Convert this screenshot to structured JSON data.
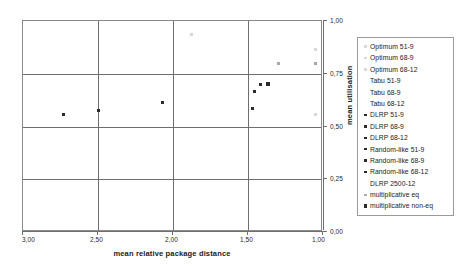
{
  "chart_data": {
    "type": "scatter",
    "title": "",
    "xlabel": "mean relative package distance",
    "ylabel": "mean utilisation",
    "xlim": [
      3.0,
      1.0
    ],
    "ylim": [
      0.0,
      1.0
    ],
    "x_axis_reversed": true,
    "y_axis_position": "right",
    "grid": true,
    "legend_position": "right-outside",
    "xticklabels": [
      "3,00",
      "2,50",
      "2,00",
      "1,50",
      "1,00"
    ],
    "xtickvalues": [
      3.0,
      2.5,
      2.0,
      1.5,
      1.0
    ],
    "yticklabels": [
      "1,00",
      "0,75",
      "0,50",
      "0,25",
      "0,00"
    ],
    "ytickvalues": [
      1.0,
      0.75,
      0.5,
      0.25,
      0.0
    ],
    "series": [
      {
        "name": "Optimum 51-9",
        "marker_style": "faint",
        "points": [
          {
            "x": 1.88,
            "y": 0.935
          }
        ]
      },
      {
        "name": "Optimum 68-9",
        "marker_style": "faint",
        "points": [
          {
            "x": 1.05,
            "y": 0.865
          }
        ]
      },
      {
        "name": "Optimum 68-12",
        "marker_style": "faint",
        "points": [
          {
            "x": 1.05,
            "y": 0.555
          }
        ]
      },
      {
        "name": "Tabu 51-9",
        "marker_style": "none",
        "points": []
      },
      {
        "name": "Tabu 68-9",
        "marker_style": "none",
        "points": []
      },
      {
        "name": "Tabu 68-12",
        "marker_style": "none",
        "points": []
      },
      {
        "name": "DLRP 51-9",
        "marker_style": "dark",
        "points": [
          {
            "x": 2.73,
            "y": 0.555
          }
        ]
      },
      {
        "name": "DLRP 68-9",
        "marker_style": "dark",
        "points": [
          {
            "x": 2.5,
            "y": 0.575
          }
        ]
      },
      {
        "name": "DLRP 68-12",
        "marker_style": "dark",
        "points": [
          {
            "x": 2.07,
            "y": 0.615
          }
        ]
      },
      {
        "name": "Random-like 51-9",
        "marker_style": "dark",
        "points": [
          {
            "x": 1.46,
            "y": 0.665
          }
        ]
      },
      {
        "name": "Random-like 68-9",
        "marker_style": "dark",
        "points": [
          {
            "x": 1.47,
            "y": 0.585
          }
        ]
      },
      {
        "name": "Random-like 68-12",
        "marker_style": "dark",
        "points": [
          {
            "x": 1.37,
            "y": 0.7
          }
        ]
      },
      {
        "name": "DLRP 2500-12",
        "marker_style": "none",
        "points": []
      },
      {
        "name": "multiplicative eq",
        "marker_style": "mid",
        "points": [
          {
            "x": 1.3,
            "y": 0.8
          },
          {
            "x": 1.05,
            "y": 0.8
          }
        ]
      },
      {
        "name": "multiplicative non-eq",
        "marker_style": "dark-big",
        "points": [
          {
            "x": 1.365,
            "y": 0.7
          }
        ]
      }
    ],
    "plotted_points": [
      {
        "x": 2.73,
        "y": 0.555,
        "style": "dark"
      },
      {
        "x": 2.5,
        "y": 0.575,
        "style": "dark"
      },
      {
        "x": 2.07,
        "y": 0.615,
        "style": "dark"
      },
      {
        "x": 1.88,
        "y": 0.935,
        "style": "faint"
      },
      {
        "x": 1.46,
        "y": 0.665,
        "style": "dark"
      },
      {
        "x": 1.47,
        "y": 0.585,
        "style": "dark"
      },
      {
        "x": 1.37,
        "y": 0.7,
        "style": "dark-big"
      },
      {
        "x": 1.3,
        "y": 0.8,
        "style": "mid"
      },
      {
        "x": 1.05,
        "y": 0.865,
        "style": "faint"
      },
      {
        "x": 1.05,
        "y": 0.8,
        "style": "mid"
      },
      {
        "x": 1.05,
        "y": 0.555,
        "style": "faint"
      },
      {
        "x": 1.42,
        "y": 0.7,
        "style": "dark"
      }
    ]
  },
  "legend": {
    "items": [
      {
        "label": "Optimum 51-9",
        "marker": "faint"
      },
      {
        "label": "Optimum 68-9",
        "marker": "faint"
      },
      {
        "label": "Optimum 68-12",
        "marker": "faint"
      },
      {
        "label": "Tabu 51-9",
        "marker": "none"
      },
      {
        "label": "Tabu 68-9",
        "marker": "none"
      },
      {
        "label": "Tabu 68-12",
        "marker": "none"
      },
      {
        "label": "DLRP 51-9",
        "marker": "dark"
      },
      {
        "label": "DLRP 68-9",
        "marker": "dark"
      },
      {
        "label": "DLRP 68-12",
        "marker": "dark"
      },
      {
        "label": "Random-like 51-9",
        "marker": "dark"
      },
      {
        "label": "Random-like 68-9",
        "marker": "dark"
      },
      {
        "label": "Random-like 68-12",
        "marker": "dark"
      },
      {
        "label": "DLRP 2500-12",
        "marker": "none"
      },
      {
        "label": "multiplicative eq",
        "marker": "mid"
      },
      {
        "label": "multiplicative non-eq",
        "marker": "dark-big"
      }
    ]
  },
  "colors": {
    "frame": "#8a8a8a",
    "gridline": "#6e6e6e",
    "marker_dark": "#2b2b2b",
    "marker_mid": "#a8a8a8",
    "marker_faint": "#d8d8d8",
    "text": "#1a1a1a",
    "background": "#ffffff"
  }
}
